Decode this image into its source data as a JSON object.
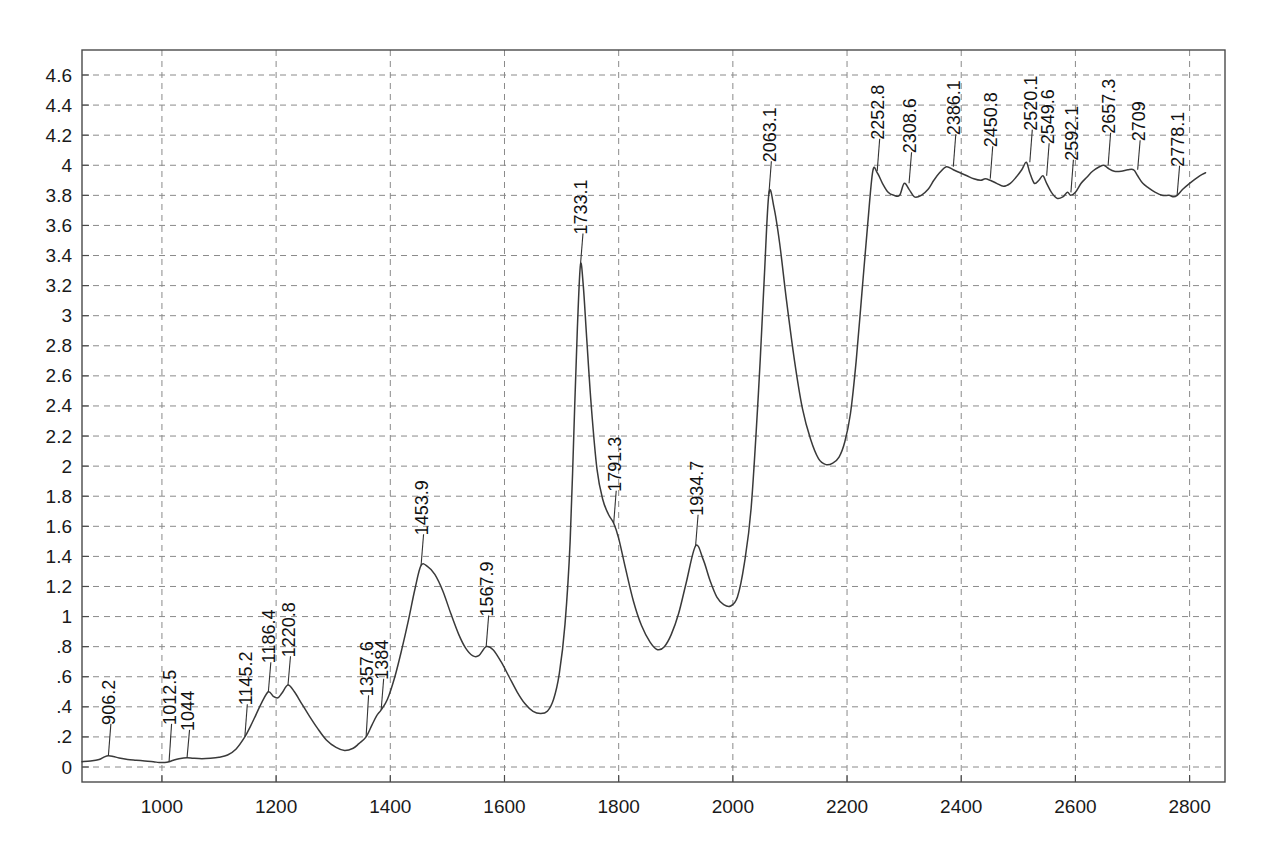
{
  "chart_data": {
    "type": "line",
    "title": "",
    "subtitle": "",
    "xlabel": "",
    "ylabel": "",
    "xlim": [
      860,
      2862
    ],
    "ylim": [
      -0.08,
      4.72
    ],
    "grid": true,
    "legend": "none",
    "curve_color": "#3a3a3a",
    "grid_color": "#8a8a8a",
    "frame_color": "#4a4a4a",
    "xticks": [
      1000,
      1200,
      1400,
      1600,
      1800,
      2000,
      2200,
      2400,
      2600,
      2800
    ],
    "xtick_labels": [
      "1000",
      "1200",
      "1400",
      "1600",
      "1800",
      "2000",
      "2200",
      "2400",
      "2600",
      "2800"
    ],
    "yticks": [
      0,
      0.2,
      0.4,
      0.6,
      0.8,
      1,
      1.2,
      1.4,
      1.6,
      1.8,
      2,
      2.2,
      2.4,
      2.6,
      2.8,
      3,
      3.2,
      3.4,
      3.6,
      3.8,
      4,
      4.2,
      4.4,
      4.6
    ],
    "ytick_labels": [
      "0",
      ".2",
      ".4",
      ".6",
      ".8",
      "1",
      "1.2",
      "1.4",
      "1.6",
      "1.8",
      "2",
      "2.2",
      "2.4",
      "2.6",
      "2.8",
      "3",
      "3.2",
      "3.4",
      "3.6",
      "3.8",
      "4",
      "4.2",
      "4.4",
      "4.6"
    ],
    "annotations": [
      {
        "label": "906.2",
        "x": 906.2,
        "y": 0.075,
        "label_y": 0.28
      },
      {
        "label": "1012.5",
        "x": 1012.5,
        "y": 0.035,
        "label_y": 0.28
      },
      {
        "label": "1044",
        "x": 1044,
        "y": 0.062,
        "label_y": 0.24
      },
      {
        "label": "1145.2",
        "x": 1145.2,
        "y": 0.2,
        "label_y": 0.41
      },
      {
        "label": "1186.4",
        "x": 1186.4,
        "y": 0.5,
        "label_y": 0.69
      },
      {
        "label": "1220.8",
        "x": 1220.8,
        "y": 0.545,
        "label_y": 0.73
      },
      {
        "label": "1357.6",
        "x": 1357.6,
        "y": 0.2,
        "label_y": 0.47
      },
      {
        "label": "1384",
        "x": 1384,
        "y": 0.38,
        "label_y": 0.58
      },
      {
        "label": "1453.9",
        "x": 1453.9,
        "y": 1.34,
        "label_y": 1.54
      },
      {
        "label": "1567.9",
        "x": 1567.9,
        "y": 0.8,
        "label_y": 1.0
      },
      {
        "label": "1733.1",
        "x": 1733.1,
        "y": 3.34,
        "label_y": 3.54
      },
      {
        "label": "1791.3",
        "x": 1791.3,
        "y": 1.62,
        "label_y": 1.83
      },
      {
        "label": "1934.7",
        "x": 1934.7,
        "y": 1.47,
        "label_y": 1.67
      },
      {
        "label": "2063.1",
        "x": 2063.1,
        "y": 3.81,
        "label_y": 4.02
      },
      {
        "label": "2252.8",
        "x": 2252.8,
        "y": 3.96,
        "label_y": 4.17
      },
      {
        "label": "2308.6",
        "x": 2308.6,
        "y": 3.88,
        "label_y": 4.08
      },
      {
        "label": "2386.1",
        "x": 2386.1,
        "y": 3.99,
        "label_y": 4.2
      },
      {
        "label": "2450.8",
        "x": 2450.8,
        "y": 3.91,
        "label_y": 4.12
      },
      {
        "label": "2520.1",
        "x": 2520.1,
        "y": 4.02,
        "label_y": 4.23
      },
      {
        "label": "2549.6",
        "x": 2549.6,
        "y": 3.93,
        "label_y": 4.14
      },
      {
        "label": "2592.1",
        "x": 2592.1,
        "y": 3.82,
        "label_y": 4.03
      },
      {
        "label": "2657.3",
        "x": 2657.3,
        "y": 4.0,
        "label_y": 4.21
      },
      {
        "label": "2709",
        "x": 2709,
        "y": 3.97,
        "label_y": 4.16
      },
      {
        "label": "2778.1",
        "x": 2778.1,
        "y": 3.8,
        "label_y": 3.99
      }
    ],
    "x": [
      860,
      875,
      890,
      898,
      906.2,
      915,
      925,
      940,
      955,
      970,
      985,
      995,
      1005,
      1012.5,
      1020,
      1030,
      1044,
      1055,
      1070,
      1085,
      1100,
      1115,
      1130,
      1145.2,
      1155,
      1165,
      1175,
      1186.4,
      1195,
      1203,
      1210,
      1220.8,
      1232,
      1245,
      1258,
      1272,
      1288,
      1305,
      1320,
      1335,
      1345,
      1357.6,
      1368,
      1376,
      1384,
      1395,
      1408,
      1420,
      1432,
      1443,
      1453.9,
      1466,
      1478,
      1492,
      1506,
      1520,
      1532,
      1544,
      1555,
      1567.9,
      1580,
      1594,
      1608,
      1622,
      1636,
      1650,
      1663,
      1675,
      1686,
      1696,
      1706,
      1715,
      1723,
      1728,
      1733.1,
      1738,
      1744,
      1752,
      1762,
      1772,
      1782,
      1791.3,
      1800,
      1812,
      1826,
      1840,
      1855,
      1868,
      1880,
      1892,
      1905,
      1918,
      1934.7,
      1948,
      1960,
      1972,
      1984,
      1996,
      2008,
      2020,
      2032,
      2045,
      2055,
      2063.1,
      2072,
      2082,
      2094,
      2108,
      2122,
      2136,
      2150,
      2163,
      2175,
      2186,
      2196,
      2206,
      2216,
      2226,
      2236,
      2245,
      2252.8,
      2262,
      2272,
      2282,
      2292,
      2300,
      2308.6,
      2318,
      2330,
      2342,
      2352,
      2362,
      2374,
      2386.1,
      2398,
      2410,
      2422,
      2434,
      2442,
      2450.8,
      2462,
      2474,
      2486,
      2496,
      2506,
      2514,
      2520.1,
      2528,
      2536,
      2543,
      2549.6,
      2558,
      2568,
      2578,
      2586,
      2592.1,
      2600,
      2610,
      2620,
      2630,
      2642,
      2650,
      2657.3,
      2668,
      2680,
      2692,
      2702,
      2709,
      2718,
      2728,
      2740,
      2752,
      2764,
      2772,
      2778.1,
      2788,
      2800,
      2814,
      2828,
      2842,
      2856,
      2862
    ],
    "y": [
      0.035,
      0.04,
      0.05,
      0.065,
      0.075,
      0.07,
      0.06,
      0.05,
      0.045,
      0.04,
      0.035,
      0.03,
      0.03,
      0.035,
      0.045,
      0.055,
      0.062,
      0.058,
      0.055,
      0.058,
      0.065,
      0.08,
      0.12,
      0.2,
      0.27,
      0.35,
      0.43,
      0.5,
      0.47,
      0.46,
      0.49,
      0.545,
      0.5,
      0.42,
      0.34,
      0.26,
      0.18,
      0.13,
      0.11,
      0.125,
      0.155,
      0.2,
      0.28,
      0.34,
      0.38,
      0.45,
      0.6,
      0.78,
      0.98,
      1.18,
      1.34,
      1.33,
      1.28,
      1.17,
      1.02,
      0.88,
      0.79,
      0.74,
      0.74,
      0.8,
      0.78,
      0.7,
      0.6,
      0.5,
      0.42,
      0.37,
      0.355,
      0.37,
      0.45,
      0.62,
      0.95,
      1.5,
      2.4,
      2.95,
      3.34,
      3.2,
      2.85,
      2.4,
      1.98,
      1.78,
      1.68,
      1.62,
      1.52,
      1.32,
      1.1,
      0.94,
      0.83,
      0.78,
      0.8,
      0.88,
      1.02,
      1.22,
      1.47,
      1.38,
      1.24,
      1.13,
      1.08,
      1.07,
      1.13,
      1.35,
      1.72,
      2.5,
      3.25,
      3.81,
      3.72,
      3.48,
      3.1,
      2.7,
      2.38,
      2.18,
      2.05,
      2.01,
      2.02,
      2.06,
      2.16,
      2.35,
      2.7,
      3.15,
      3.6,
      3.96,
      3.95,
      3.88,
      3.82,
      3.8,
      3.8,
      3.88,
      3.84,
      3.79,
      3.8,
      3.84,
      3.9,
      3.95,
      3.99,
      3.97,
      3.95,
      3.93,
      3.91,
      3.9,
      3.91,
      3.9,
      3.88,
      3.86,
      3.88,
      3.92,
      3.97,
      4.02,
      3.95,
      3.88,
      3.9,
      3.93,
      3.88,
      3.82,
      3.78,
      3.79,
      3.82,
      3.8,
      3.82,
      3.88,
      3.92,
      3.96,
      3.99,
      4.0,
      3.98,
      3.96,
      3.96,
      3.97,
      3.97,
      3.93,
      3.88,
      3.85,
      3.82,
      3.8,
      3.8,
      3.79,
      3.8,
      3.84,
      3.88,
      3.92,
      3.95,
      3.96
    ]
  }
}
